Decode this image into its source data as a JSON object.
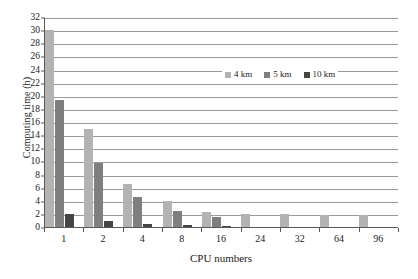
{
  "chart_data": {
    "type": "bar",
    "title": "",
    "xlabel": "CPU numbers",
    "ylabel": "Computing time (h)",
    "categories": [
      "1",
      "2",
      "4",
      "8",
      "16",
      "24",
      "32",
      "64",
      "96"
    ],
    "series": [
      {
        "name": "4 km",
        "color": "#b3b3b3",
        "values": [
          30.0,
          15.0,
          6.6,
          4.0,
          2.3,
          2.0,
          2.0,
          1.9,
          1.9
        ]
      },
      {
        "name": "5 km",
        "color": "#7f7f7f",
        "values": [
          19.3,
          9.7,
          4.6,
          2.4,
          1.5,
          0,
          0,
          0,
          0
        ]
      },
      {
        "name": "10 km",
        "color": "#454545",
        "values": [
          2.0,
          0.9,
          0.4,
          0.3,
          0.2,
          0,
          0,
          0,
          0
        ]
      }
    ],
    "ylim": [
      0,
      32
    ],
    "ytick_step": 2,
    "yticks": [
      0,
      2,
      4,
      6,
      8,
      10,
      12,
      14,
      16,
      18,
      20,
      22,
      24,
      26,
      28,
      30,
      32
    ],
    "grid": true,
    "grid_axis": "y",
    "legend_position": "inside-top-right",
    "axis_color": "#595959",
    "grid_color": "#9a9a9a",
    "background": "#ffffff"
  }
}
